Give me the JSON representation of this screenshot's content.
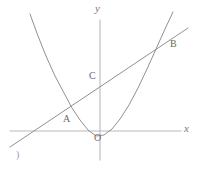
{
  "figure": {
    "background_color": "#ffffff",
    "width": 199,
    "height": 169,
    "stroke_color_axis": "#b9b9b9",
    "stroke_color_curve": "#8a8a8a",
    "stroke_color_line": "#8a8a8a",
    "corner_mark": ")"
  },
  "axes": {
    "x_label": "x",
    "y_label": "y",
    "origin_label": "O",
    "origin_px": {
      "x": 100,
      "y": 131
    },
    "x_axis_px": {
      "x1": 10,
      "y1": 131,
      "x2": 181,
      "y2": 131
    },
    "y_axis_px": {
      "x1": 100,
      "y1": 20,
      "x2": 100,
      "y2": 160
    },
    "x_label_px": {
      "x": 184,
      "y": 124
    },
    "y_label_px": {
      "x": 95,
      "y": 4
    },
    "origin_label_px": {
      "x": 94,
      "y": 133
    }
  },
  "points": [
    {
      "id": "A",
      "label": "A",
      "label_px": {
        "x": 64,
        "y": 115
      },
      "point_px": {
        "x": 64,
        "y": 112
      }
    },
    {
      "id": "B",
      "label": "B",
      "label_px": {
        "x": 171,
        "y": 40
      },
      "point_px": {
        "x": 166,
        "y": 41
      }
    },
    {
      "id": "C",
      "label": "C",
      "label_px": {
        "x": 90,
        "y": 72
      },
      "point_px": {
        "x": 100,
        "y": 82
      }
    }
  ],
  "chart_data": {
    "type": "line",
    "title": "",
    "xlabel": "x",
    "ylabel": "y",
    "grid": false,
    "legend": null,
    "annotations": [
      "A",
      "B",
      "C",
      "O",
      ")"
    ],
    "series": [
      {
        "name": "parabola",
        "kind": "quadratic-curve",
        "description": "Upward-opening parabola with vertex just below the origin and slightly left of the y-axis",
        "vertex_px": {
          "x": 96,
          "y": 136
        },
        "path_px": [
          {
            "x": 30,
            "y": 14
          },
          {
            "x": 38,
            "y": 36
          },
          {
            "x": 46,
            "y": 56
          },
          {
            "x": 55,
            "y": 76
          },
          {
            "x": 64,
            "y": 93
          },
          {
            "x": 72,
            "y": 108
          },
          {
            "x": 80,
            "y": 120
          },
          {
            "x": 88,
            "y": 130
          },
          {
            "x": 96,
            "y": 136
          },
          {
            "x": 104,
            "y": 135
          },
          {
            "x": 112,
            "y": 129
          },
          {
            "x": 120,
            "y": 119
          },
          {
            "x": 129,
            "y": 105
          },
          {
            "x": 138,
            "y": 88
          },
          {
            "x": 147,
            "y": 69
          },
          {
            "x": 156,
            "y": 49
          },
          {
            "x": 165,
            "y": 29
          },
          {
            "x": 173,
            "y": 12
          }
        ]
      },
      {
        "name": "secant-line",
        "kind": "straight-line",
        "description": "Straight line crossing the parabola at A and B and the y-axis at C",
        "path_px": [
          {
            "x": 10,
            "y": 147
          },
          {
            "x": 188,
            "y": 28
          }
        ]
      }
    ],
    "axis_lines": [
      {
        "name": "x-axis",
        "from_px": {
          "x": 10,
          "y": 131
        },
        "to_px": {
          "x": 181,
          "y": 131
        }
      },
      {
        "name": "y-axis",
        "from_px": {
          "x": 100,
          "y": 20
        },
        "to_px": {
          "x": 100,
          "y": 160
        }
      }
    ]
  }
}
